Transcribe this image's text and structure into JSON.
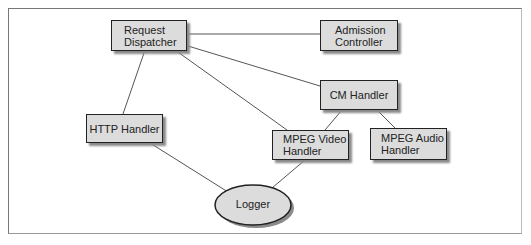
{
  "diagram": {
    "nodes": {
      "request_dispatcher": {
        "line1": "Request",
        "line2": "Dispatcher"
      },
      "admission_controller": {
        "line1": "Admission",
        "line2": "Controller"
      },
      "cm_handler": {
        "label": "CM Handler"
      },
      "http_handler": {
        "label": "HTTP Handler"
      },
      "mpeg_video_handler": {
        "line1": "MPEG Video",
        "line2": "Handler"
      },
      "mpeg_audio_handler": {
        "line1": "MPEG Audio",
        "line2": "Handler"
      },
      "logger": {
        "label": "Logger"
      }
    },
    "edges": [
      {
        "from": "Request Dispatcher",
        "to": "Admission Controller"
      },
      {
        "from": "Request Dispatcher",
        "to": "CM Handler"
      },
      {
        "from": "Request Dispatcher",
        "to": "HTTP Handler"
      },
      {
        "from": "Request Dispatcher",
        "to": "MPEG Video Handler"
      },
      {
        "from": "CM Handler",
        "to": "MPEG Video Handler"
      },
      {
        "from": "CM Handler",
        "to": "MPEG Audio Handler"
      },
      {
        "from": "HTTP Handler",
        "to": "Logger"
      },
      {
        "from": "MPEG Video Handler",
        "to": "Logger"
      }
    ],
    "colors": {
      "node_fill": "#dcdcdc",
      "node_border": "#222222",
      "edge": "#555555",
      "shadow": "#8a8a8a"
    }
  }
}
